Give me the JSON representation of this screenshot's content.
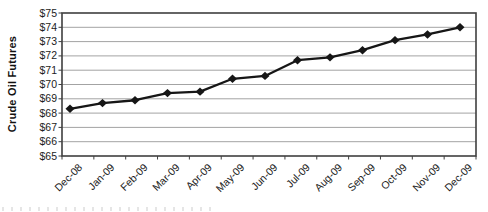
{
  "chart_data": {
    "type": "line",
    "title": "",
    "xlabel": "",
    "ylabel": "Crude Oil Futures",
    "categories": [
      "Dec-08",
      "Jan-09",
      "Feb-09",
      "Mar-09",
      "Apr-09",
      "May-09",
      "Jun-09",
      "Jul-09",
      "Aug-09",
      "Sep-09",
      "Oct-09",
      "Nov-09",
      "Dec-09"
    ],
    "series": [
      {
        "name": "Crude Oil Futures",
        "values": [
          68.3,
          68.7,
          68.9,
          69.4,
          69.5,
          70.4,
          70.6,
          71.7,
          71.9,
          72.4,
          73.1,
          73.5,
          74.0
        ]
      }
    ],
    "ylim": [
      65,
      75
    ],
    "ytick_step": 1,
    "ytick_labels": [
      "$65",
      "$66",
      "$67",
      "$68",
      "$69",
      "$70",
      "$71",
      "$72",
      "$73",
      "$74",
      "$75"
    ],
    "grid": "horizontal-only",
    "legend": "none",
    "marker": "diamond",
    "colors": {
      "line": "#161616",
      "marker": "#161616",
      "gridline": "#a3a3a3",
      "plot_border": "#3f3f3f",
      "text": "#1c1c1c",
      "background": "#ffffff"
    }
  }
}
